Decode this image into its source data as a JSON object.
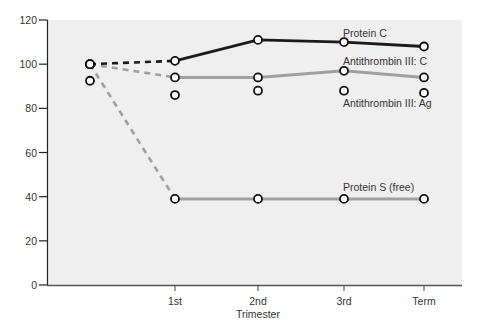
{
  "chart_data": {
    "type": "line",
    "title": "",
    "xlabel": "Trimester",
    "ylabel": "",
    "ylim": [
      0,
      120
    ],
    "yticks": [
      0,
      20,
      40,
      60,
      80,
      100,
      120
    ],
    "categories": [
      "Baseline",
      "1st",
      "2nd",
      "3rd",
      "Term"
    ],
    "x_tick_labels": [
      "1st",
      "2nd",
      "3rd",
      "Term"
    ],
    "grid": false,
    "legend": "inline labels near series end",
    "series": [
      {
        "name": "Protein C",
        "color": "#1a1a1a",
        "values": [
          100,
          101.5,
          111,
          110,
          108
        ],
        "dashed_segment": "Baseline-1st"
      },
      {
        "name": "Antithrombin III: C",
        "color": "#a0a0a0",
        "values": [
          100,
          94,
          94,
          97,
          94
        ],
        "dashed_segment": "Baseline-1st"
      },
      {
        "name": "Antithrombin III: Ag",
        "color": "#1a1a1a",
        "values": [
          92.5,
          86,
          88,
          88,
          87
        ],
        "markers_only": true
      },
      {
        "name": "Protein S (free)",
        "color": "#a0a0a0",
        "values": [
          100,
          39,
          39,
          39,
          39
        ],
        "dashed_segment": "Baseline-1st"
      }
    ]
  },
  "labels": {
    "protein_c": "Protein C",
    "atiii_c": "Antithrombin III: C",
    "atiii_ag": "Antithrombin III: Ag",
    "protein_s": "Protein S (free)",
    "x_title": "Trimester",
    "x_ticks": [
      "1st",
      "2nd",
      "3rd",
      "Term"
    ],
    "y_ticks": [
      "0",
      "20",
      "40",
      "60",
      "80",
      "100",
      "120"
    ]
  }
}
